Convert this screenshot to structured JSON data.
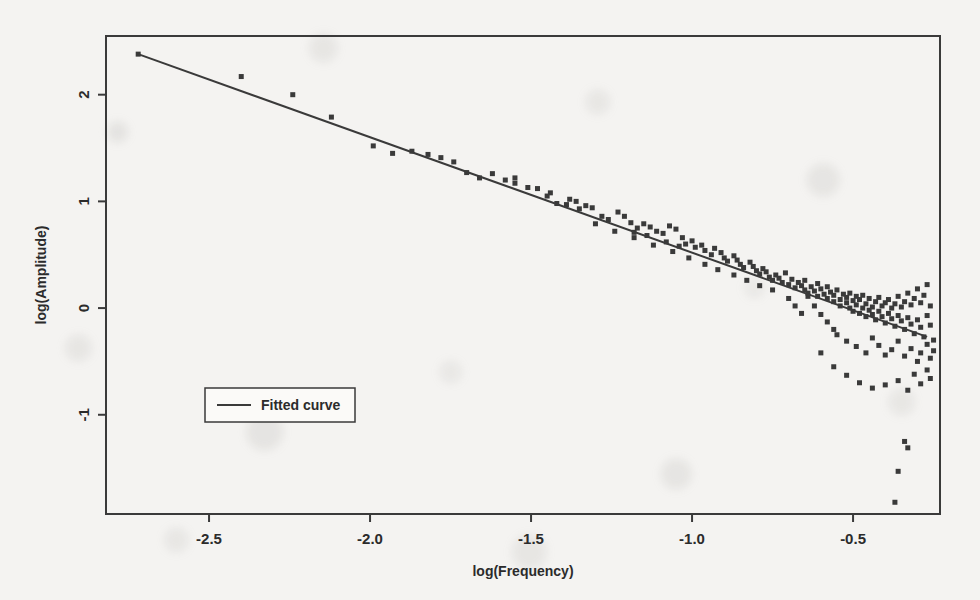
{
  "figure": {
    "background_color": "#f4f3f1",
    "ink_color": "#3a3a3a",
    "frame": {
      "left": 106,
      "right": 940,
      "top": 36,
      "bottom": 514
    }
  },
  "chart_data": {
    "type": "scatter",
    "title": "",
    "xlabel": "log(Frequency)",
    "ylabel": "log(Amplitude)",
    "xlim": [
      -2.82,
      -0.23
    ],
    "ylim": [
      -1.93,
      2.55
    ],
    "xticks": [
      -2.5,
      -2.0,
      -1.5,
      -1.0,
      -0.5
    ],
    "xtick_labels": [
      "-2.5",
      "-2.0",
      "-1.5",
      "-1.0",
      "-0.5"
    ],
    "yticks": [
      2,
      1,
      0,
      -1
    ],
    "ytick_labels": [
      "2",
      "1",
      "0",
      "-1"
    ],
    "grid": false,
    "legend": {
      "position": "center-left",
      "entries": [
        "Fitted curve"
      ]
    },
    "series": [
      {
        "name": "Observations",
        "type": "scatter",
        "marker": "square",
        "marker_size": 5,
        "color": "#3a3a3a",
        "points": [
          [
            -2.72,
            2.38
          ],
          [
            -2.4,
            2.17
          ],
          [
            -2.24,
            2.0
          ],
          [
            -2.12,
            1.79
          ],
          [
            -1.99,
            1.52
          ],
          [
            -1.93,
            1.45
          ],
          [
            -1.87,
            1.47
          ],
          [
            -1.82,
            1.44
          ],
          [
            -1.78,
            1.41
          ],
          [
            -1.74,
            1.37
          ],
          [
            -1.7,
            1.27
          ],
          [
            -1.66,
            1.22
          ],
          [
            -1.62,
            1.26
          ],
          [
            -1.58,
            1.2
          ],
          [
            -1.55,
            1.17
          ],
          [
            -1.51,
            1.13
          ],
          [
            -1.48,
            1.12
          ],
          [
            -1.45,
            1.05
          ],
          [
            -1.42,
            0.98
          ],
          [
            -1.39,
            0.97
          ],
          [
            -1.36,
            1.0
          ],
          [
            -1.33,
            0.96
          ],
          [
            -1.31,
            0.94
          ],
          [
            -1.28,
            0.86
          ],
          [
            -1.26,
            0.83
          ],
          [
            -1.23,
            0.9
          ],
          [
            -1.21,
            0.86
          ],
          [
            -1.19,
            0.8
          ],
          [
            -1.17,
            0.75
          ],
          [
            -1.15,
            0.79
          ],
          [
            -1.13,
            0.76
          ],
          [
            -1.11,
            0.72
          ],
          [
            -1.09,
            0.7
          ],
          [
            -1.07,
            0.77
          ],
          [
            -1.05,
            0.74
          ],
          [
            -1.03,
            0.66
          ],
          [
            -1.02,
            0.6
          ],
          [
            -1.0,
            0.63
          ],
          [
            -0.99,
            0.57
          ],
          [
            -0.97,
            0.59
          ],
          [
            -0.96,
            0.54
          ],
          [
            -0.94,
            0.5
          ],
          [
            -0.93,
            0.56
          ],
          [
            -0.91,
            0.52
          ],
          [
            -0.9,
            0.47
          ],
          [
            -0.89,
            0.44
          ],
          [
            -0.87,
            0.49
          ],
          [
            -0.86,
            0.45
          ],
          [
            -0.85,
            0.41
          ],
          [
            -0.84,
            0.38
          ],
          [
            -0.82,
            0.43
          ],
          [
            -0.81,
            0.39
          ],
          [
            -0.8,
            0.35
          ],
          [
            -0.79,
            0.32
          ],
          [
            -0.78,
            0.37
          ],
          [
            -0.77,
            0.34
          ],
          [
            -0.76,
            0.29
          ],
          [
            -0.75,
            0.26
          ],
          [
            -0.74,
            0.31
          ],
          [
            -0.73,
            0.28
          ],
          [
            -0.72,
            0.24
          ],
          [
            -0.71,
            0.33
          ],
          [
            -0.7,
            0.22
          ],
          [
            -0.69,
            0.27
          ],
          [
            -0.68,
            0.19
          ],
          [
            -0.67,
            0.24
          ],
          [
            -0.66,
            0.21
          ],
          [
            -0.65,
            0.17
          ],
          [
            -0.65,
            0.26
          ],
          [
            -0.64,
            0.14
          ],
          [
            -0.63,
            0.2
          ],
          [
            -0.62,
            0.16
          ],
          [
            -0.61,
            0.23
          ],
          [
            -0.61,
            0.11
          ],
          [
            -0.6,
            0.18
          ],
          [
            -0.59,
            0.13
          ],
          [
            -0.58,
            0.09
          ],
          [
            -0.58,
            0.2
          ],
          [
            -0.57,
            0.15
          ],
          [
            -0.56,
            0.06
          ],
          [
            -0.56,
            0.12
          ],
          [
            -0.55,
            0.17
          ],
          [
            -0.54,
            0.08
          ],
          [
            -0.54,
            0.02
          ],
          [
            -0.53,
            0.13
          ],
          [
            -0.52,
            0.05
          ],
          [
            -0.52,
            0.1
          ],
          [
            -0.51,
            0.0
          ],
          [
            -0.51,
            0.14
          ],
          [
            -0.5,
            0.07
          ],
          [
            -0.5,
            -0.03
          ],
          [
            -0.49,
            0.11
          ],
          [
            -0.49,
            0.03
          ],
          [
            -0.48,
            -0.05
          ],
          [
            -0.48,
            0.08
          ],
          [
            -0.47,
            0.0
          ],
          [
            -0.47,
            0.12
          ],
          [
            -0.46,
            -0.08
          ],
          [
            -0.46,
            0.04
          ],
          [
            -0.45,
            -0.02
          ],
          [
            -0.45,
            0.09
          ],
          [
            -0.44,
            -0.06
          ],
          [
            -0.44,
            0.01
          ],
          [
            -0.43,
            -0.11
          ],
          [
            -0.43,
            0.06
          ],
          [
            -0.42,
            -0.03
          ],
          [
            -0.42,
            0.1
          ],
          [
            -0.41,
            -0.08
          ],
          [
            -0.41,
            0.02
          ],
          [
            -0.4,
            -0.14
          ],
          [
            -0.4,
            0.05
          ],
          [
            -0.39,
            -0.05
          ],
          [
            -0.39,
            0.08
          ],
          [
            -0.38,
            -0.1
          ],
          [
            -0.38,
            0.0
          ],
          [
            -0.37,
            -0.17
          ],
          [
            -0.37,
            0.04
          ],
          [
            -0.36,
            -0.07
          ],
          [
            -0.36,
            0.11
          ],
          [
            -0.35,
            -0.12
          ],
          [
            -0.35,
            0.01
          ],
          [
            -0.34,
            -0.2
          ],
          [
            -0.34,
            0.06
          ],
          [
            -0.33,
            -0.09
          ],
          [
            -0.33,
            0.14
          ],
          [
            -0.32,
            -0.15
          ],
          [
            -0.32,
            0.03
          ],
          [
            -0.31,
            -0.24
          ],
          [
            -0.31,
            0.09
          ],
          [
            -0.3,
            -0.11
          ],
          [
            -0.3,
            0.18
          ],
          [
            -0.29,
            -0.18
          ],
          [
            -0.29,
            0.05
          ],
          [
            -0.28,
            -0.27
          ],
          [
            -0.28,
            0.12
          ],
          [
            -0.27,
            -0.07
          ],
          [
            -0.27,
            0.22
          ],
          [
            -0.26,
            -0.16
          ],
          [
            -0.26,
            0.02
          ],
          [
            -0.25,
            -0.3
          ],
          [
            -0.62,
            0.02
          ],
          [
            -0.6,
            -0.06
          ],
          [
            -0.58,
            -0.13
          ],
          [
            -0.56,
            -0.2
          ],
          [
            -0.7,
            0.09
          ],
          [
            -0.68,
            0.02
          ],
          [
            -0.66,
            -0.05
          ],
          [
            -0.64,
            0.11
          ],
          [
            -0.75,
            0.17
          ],
          [
            -0.79,
            0.21
          ],
          [
            -0.83,
            0.26
          ],
          [
            -0.87,
            0.31
          ],
          [
            -0.92,
            0.36
          ],
          [
            -0.96,
            0.41
          ],
          [
            -1.01,
            0.47
          ],
          [
            -1.06,
            0.53
          ],
          [
            -1.12,
            0.59
          ],
          [
            -1.18,
            0.66
          ],
          [
            -1.24,
            0.72
          ],
          [
            -1.3,
            0.79
          ],
          [
            -0.55,
            -0.25
          ],
          [
            -0.52,
            -0.31
          ],
          [
            -0.49,
            -0.36
          ],
          [
            -0.46,
            -0.42
          ],
          [
            -0.44,
            -0.28
          ],
          [
            -0.42,
            -0.35
          ],
          [
            -0.4,
            -0.44
          ],
          [
            -0.38,
            -0.39
          ],
          [
            -0.36,
            -0.31
          ],
          [
            -0.34,
            -0.45
          ],
          [
            -0.32,
            -0.38
          ],
          [
            -0.3,
            -0.5
          ],
          [
            -0.29,
            -0.42
          ],
          [
            -0.27,
            -0.34
          ],
          [
            -0.26,
            -0.47
          ],
          [
            -0.25,
            -0.4
          ],
          [
            -0.6,
            -0.42
          ],
          [
            -0.56,
            -0.55
          ],
          [
            -0.52,
            -0.63
          ],
          [
            -0.48,
            -0.7
          ],
          [
            -0.44,
            -0.75
          ],
          [
            -0.4,
            -0.72
          ],
          [
            -0.36,
            -0.68
          ],
          [
            -0.33,
            -0.77
          ],
          [
            -0.31,
            -0.62
          ],
          [
            -0.29,
            -0.71
          ],
          [
            -0.27,
            -0.58
          ],
          [
            -0.26,
            -0.66
          ],
          [
            -0.34,
            -1.25
          ],
          [
            -0.33,
            -1.31
          ],
          [
            -0.36,
            -1.53
          ],
          [
            -0.37,
            -1.82
          ],
          [
            -1.55,
            1.22
          ],
          [
            -1.44,
            1.08
          ],
          [
            -1.38,
            1.02
          ],
          [
            -1.35,
            0.93
          ],
          [
            -1.18,
            0.71
          ],
          [
            -1.14,
            0.68
          ],
          [
            -1.08,
            0.62
          ],
          [
            -1.04,
            0.58
          ]
        ]
      },
      {
        "name": "Fitted curve",
        "type": "line",
        "color": "#3a3a3a",
        "linewidth": 2,
        "slope": -1.08,
        "intercept": -0.56,
        "endpoints": [
          [
            -2.72,
            2.38
          ],
          [
            -0.27,
            -0.27
          ]
        ]
      }
    ]
  }
}
